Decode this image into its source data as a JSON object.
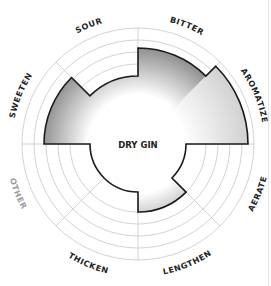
{
  "chart_data": {
    "type": "radial-bar",
    "title": "DRY GIN",
    "center_label": "DRY GIN",
    "categories": [
      "BITTER",
      "AROMATIZE",
      "AERATE",
      "LENGTHEN",
      "THICKEN",
      "OTHER",
      "SWEETEN",
      "SOUR"
    ],
    "values": [
      4,
      5,
      0,
      1,
      0,
      0,
      4,
      1
    ],
    "scale": {
      "min": 0,
      "max": 5,
      "rings": 6
    },
    "label_colors": {
      "BITTER": "#222222",
      "AROMATIZE": "#222222",
      "AERATE": "#222222",
      "LENGTHEN": "#222222",
      "THICKEN": "#222222",
      "OTHER": "#9a9a9a",
      "SWEETEN": "#222222",
      "SOUR": "#222222"
    },
    "grid": true,
    "legend": "none"
  },
  "geometry": {
    "cx": 138,
    "cy": 144,
    "ring_radii": [
      48,
      68,
      80,
      92,
      104,
      116
    ],
    "sector_radii": [
      96,
      110,
      48,
      68,
      48,
      48,
      94,
      68
    ],
    "label_radius": 126
  },
  "colors": {
    "grid": "#c8c8c8",
    "outline": "#1a1a1a",
    "fill_dark": "#7a7a7a",
    "fill_light": "#ffffff",
    "aromatize_fill": "#d9d9d9",
    "center_text": "#222222"
  }
}
